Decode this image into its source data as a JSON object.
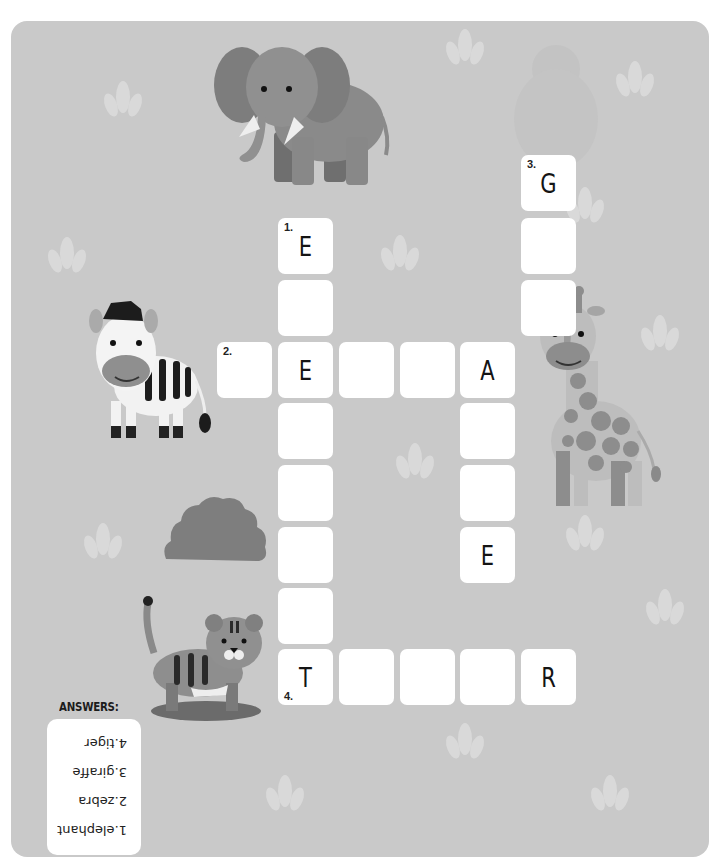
{
  "puzzle": {
    "title": "Animal crossword",
    "colors": {
      "background": "#c9c9c9",
      "cell": "#ffffff",
      "letter": "#141414",
      "leaf": "#d8d8d8"
    },
    "cells": [
      {
        "id": "r1c5",
        "col": 5,
        "row": 0,
        "letter": "G",
        "number": "3."
      },
      {
        "id": "r1c1",
        "col": 1,
        "row": 1,
        "letter": "E",
        "number": "1."
      },
      {
        "id": "c5r1",
        "col": 5,
        "row": 1,
        "letter": "",
        "number": ""
      },
      {
        "id": "c1r2",
        "col": 1,
        "row": 2,
        "letter": "",
        "number": ""
      },
      {
        "id": "c5r2",
        "col": 5,
        "row": 2,
        "letter": "",
        "number": ""
      },
      {
        "id": "c0r3",
        "col": 0,
        "row": 3,
        "letter": "",
        "number": "2."
      },
      {
        "id": "c1r3",
        "col": 1,
        "row": 3,
        "letter": "E",
        "number": ""
      },
      {
        "id": "c2r3",
        "col": 2,
        "row": 3,
        "letter": "",
        "number": ""
      },
      {
        "id": "c3r3",
        "col": 3,
        "row": 3,
        "letter": "",
        "number": ""
      },
      {
        "id": "c4r3",
        "col": 4,
        "row": 3,
        "letter": "A",
        "number": ""
      },
      {
        "id": "c1r4",
        "col": 1,
        "row": 4,
        "letter": "",
        "number": ""
      },
      {
        "id": "c4r4",
        "col": 4,
        "row": 4,
        "letter": "",
        "number": ""
      },
      {
        "id": "c1r5",
        "col": 1,
        "row": 5,
        "letter": "",
        "number": ""
      },
      {
        "id": "c4r5",
        "col": 4,
        "row": 5,
        "letter": "",
        "number": ""
      },
      {
        "id": "c1r6",
        "col": 1,
        "row": 6,
        "letter": "",
        "number": ""
      },
      {
        "id": "c4r6",
        "col": 4,
        "row": 6,
        "letter": "E",
        "number": ""
      },
      {
        "id": "c1r7",
        "col": 1,
        "row": 7,
        "letter": "",
        "number": ""
      },
      {
        "id": "c1r8",
        "col": 1,
        "row": 8,
        "letter": "T",
        "number": "4."
      },
      {
        "id": "c2r8",
        "col": 2,
        "row": 8,
        "letter": "",
        "number": ""
      },
      {
        "id": "c3r8",
        "col": 3,
        "row": 8,
        "letter": "",
        "number": ""
      },
      {
        "id": "c4r8",
        "col": 4,
        "row": 8,
        "letter": "",
        "number": ""
      },
      {
        "id": "c5r8",
        "col": 5,
        "row": 8,
        "letter": "R",
        "number": ""
      }
    ]
  },
  "answers": {
    "title": "ANSWERS:",
    "items": [
      "1.elephant",
      "2.zebra",
      "3.giraffe",
      "4.tiger"
    ]
  },
  "illustrations": [
    "elephant",
    "zebra",
    "giraffe",
    "bush",
    "tiger"
  ]
}
